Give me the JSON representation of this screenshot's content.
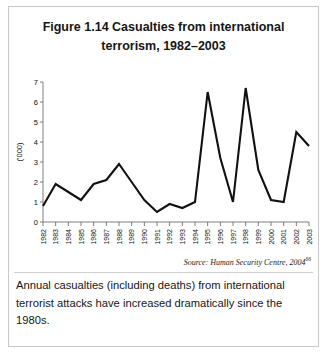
{
  "figure": {
    "title": "Figure 1.14 Casualties from international terrorism, 1982–2003",
    "source": "Source: Human Security Centre, 2004",
    "source_superscript": "66",
    "caption": "Annual casualties (including deaths) from international terrorist attacks have increased dramatically since the 1980s."
  },
  "chart_data": {
    "type": "line",
    "title": "Figure 1.14 Casualties from international terrorism, 1982–2003",
    "xlabel": "",
    "ylabel": "('000)",
    "ylim": [
      0,
      7
    ],
    "yticks": [
      0,
      1,
      2,
      3,
      4,
      5,
      6,
      7
    ],
    "grid": false,
    "legend": "none",
    "line_color": "#111111",
    "categories": [
      "1982",
      "1983",
      "1984",
      "1985",
      "1986",
      "1987",
      "1988",
      "1989",
      "1990",
      "1991",
      "1992",
      "1993",
      "1994",
      "1995",
      "1996",
      "1997",
      "1998",
      "1999",
      "2000",
      "2001",
      "2002",
      "2003"
    ],
    "values": [
      0.8,
      1.9,
      1.5,
      1.1,
      1.9,
      2.1,
      2.9,
      2.0,
      1.1,
      0.5,
      0.9,
      0.7,
      1.0,
      6.5,
      3.2,
      1.0,
      6.7,
      2.6,
      1.1,
      1.0,
      4.5,
      3.8
    ],
    "annotations": []
  }
}
